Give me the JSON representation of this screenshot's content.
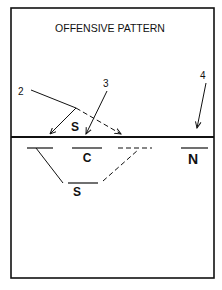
{
  "diagram": {
    "title": "OFFENSIVE PATTERN",
    "colors": {
      "ink": "#111111",
      "background": "#ffffff"
    },
    "callouts": [
      {
        "id": "2",
        "label": "2",
        "x": 18,
        "y": 87
      },
      {
        "id": "3",
        "label": "3",
        "x": 103,
        "y": 79
      },
      {
        "id": "4",
        "label": "4",
        "x": 200,
        "y": 71
      }
    ],
    "players_top": [
      {
        "id": "setter-top",
        "label": "S",
        "x": 75,
        "y": 121
      }
    ],
    "players_bottom": [
      {
        "id": "center",
        "label": "C",
        "x": 87,
        "y": 152
      },
      {
        "id": "setter-bottom",
        "label": "S",
        "x": 77,
        "y": 186
      },
      {
        "id": "n-player",
        "label": "N",
        "x": 193,
        "y": 152
      }
    ],
    "net_label": "net"
  }
}
